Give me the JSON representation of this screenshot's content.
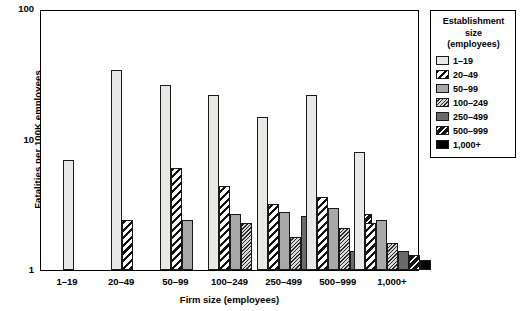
{
  "chart_data": {
    "type": "bar",
    "title": "",
    "xlabel": "Firm size (employees)",
    "ylabel": "Fatalities per 100K employees",
    "yscale": "log",
    "ylim": [
      1,
      100
    ],
    "yticks": [
      1,
      10,
      100
    ],
    "ytick_labels": [
      "1",
      "10",
      "100"
    ],
    "grid": false,
    "legend_position": "right",
    "legend_title": "Establishment size (employees)",
    "categories": [
      "1–19",
      "20–49",
      "50–99",
      "100–249",
      "250–499",
      "500–999",
      "1,000+"
    ],
    "series": [
      {
        "name": "1–19",
        "pattern": "light-gray-plain",
        "values": [
          7.0,
          34.0,
          26.0,
          22.0,
          15.0,
          22.0,
          8.0
        ]
      },
      {
        "name": "20–49",
        "pattern": "white-black-diagonal",
        "values": [
          null,
          2.4,
          6.1,
          4.4,
          3.2,
          3.6,
          2.3
        ]
      },
      {
        "name": "50–99",
        "pattern": "medium-gray-plain",
        "values": [
          null,
          null,
          2.4,
          2.7,
          2.8,
          3.0,
          2.4
        ]
      },
      {
        "name": "100–249",
        "pattern": "gray-dense-diagonal",
        "values": [
          null,
          null,
          null,
          2.3,
          1.8,
          2.1,
          1.6
        ]
      },
      {
        "name": "250–499",
        "pattern": "dark-gray-plain",
        "values": [
          null,
          null,
          null,
          null,
          2.6,
          1.4,
          1.4
        ]
      },
      {
        "name": "500–999",
        "pattern": "black-white-diagonal",
        "values": [
          null,
          null,
          null,
          null,
          null,
          2.7,
          1.3
        ]
      },
      {
        "name": "1,000+",
        "pattern": "solid-black",
        "values": [
          null,
          null,
          null,
          null,
          null,
          null,
          1.2
        ]
      }
    ]
  },
  "legend": {
    "title_line1": "Establishment",
    "title_line2": "size",
    "title_line3": "(employees)",
    "items": [
      {
        "label": "1–19",
        "pattern_class": "p1"
      },
      {
        "label": "20–49",
        "pattern_class": "p2"
      },
      {
        "label": "50–99",
        "pattern_class": "p3"
      },
      {
        "label": "100–249",
        "pattern_class": "p4"
      },
      {
        "label": "250–499",
        "pattern_class": "p5"
      },
      {
        "label": "500–999",
        "pattern_class": "p6"
      },
      {
        "label": "1,000+",
        "pattern_class": "p7"
      }
    ]
  }
}
